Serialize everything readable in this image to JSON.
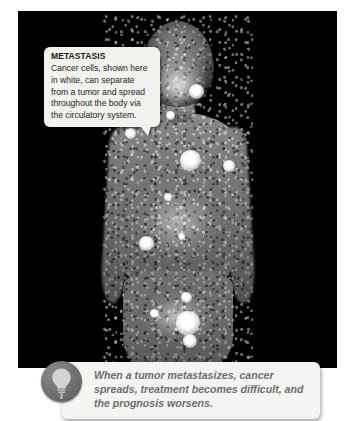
{
  "figure": {
    "alt_name": "whole-body-bone-scan",
    "background_color": "#000000"
  },
  "callout": {
    "title": "METASTASIS",
    "body": "Cancer cells, shown here in white, can separate from a tumor and spread throughout the body via the circulatory system.",
    "background_color": "#f2f2ef",
    "title_color": "#1a1a1a",
    "body_color": "#242424"
  },
  "caption": {
    "icon": "lightbulb-icon",
    "text": "When a tumor metastasizes, cancer spreads, treatment becomes difficult, and the prognosis worsens.",
    "background_color": "#f4f4f2",
    "text_color": "#6d6d6d",
    "badge_color": "#6f6f6f"
  },
  "lesions": [
    {
      "name": "lesion-skull-base-left",
      "x": 121,
      "y": 78,
      "size": 16
    },
    {
      "name": "lesion-skull-base-right",
      "x": 178,
      "y": 80,
      "size": 15
    },
    {
      "name": "lesion-cervical-spine",
      "x": 152,
      "y": 104,
      "size": 9
    },
    {
      "name": "lesion-right-shoulder",
      "x": 112,
      "y": 122,
      "size": 11
    },
    {
      "name": "lesion-upper-thoracic",
      "x": 172,
      "y": 149,
      "size": 21
    },
    {
      "name": "lesion-left-scapula",
      "x": 211,
      "y": 155,
      "size": 12
    },
    {
      "name": "lesion-mid-thoracic",
      "x": 150,
      "y": 186,
      "size": 8
    },
    {
      "name": "lesion-lower-rib-right",
      "x": 128,
      "y": 232,
      "size": 15
    },
    {
      "name": "lesion-lumbar-spine",
      "x": 163,
      "y": 225,
      "size": 7
    },
    {
      "name": "lesion-sacral-upper",
      "x": 168,
      "y": 286,
      "size": 11
    },
    {
      "name": "lesion-iliac-right",
      "x": 136,
      "y": 302,
      "size": 9
    },
    {
      "name": "lesion-sacrum-main",
      "x": 170,
      "y": 312,
      "size": 24
    },
    {
      "name": "lesion-pelvis-lower",
      "x": 172,
      "y": 330,
      "size": 14
    }
  ]
}
